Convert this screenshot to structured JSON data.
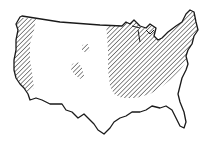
{
  "map": {
    "subject": "contiguous United States outline",
    "style": "black-and-white line drawing with diagonal hatching",
    "colors": {
      "background": "#ffffff",
      "outline": "#1a1a1a",
      "hatch": "#2a2a2a"
    },
    "hatched_regions": [
      {
        "name": "west-coast-strip",
        "description": "Pacific coast strip from Washington to central California"
      },
      {
        "name": "interior-patch-north",
        "description": "small hatched patch in northern Rockies area"
      },
      {
        "name": "interior-patch-south",
        "description": "small hatched patch in central Rockies area"
      },
      {
        "name": "eastern-region",
        "description": "eastern half from Great Plains to Atlantic coast, Great Lakes and New England"
      }
    ]
  }
}
